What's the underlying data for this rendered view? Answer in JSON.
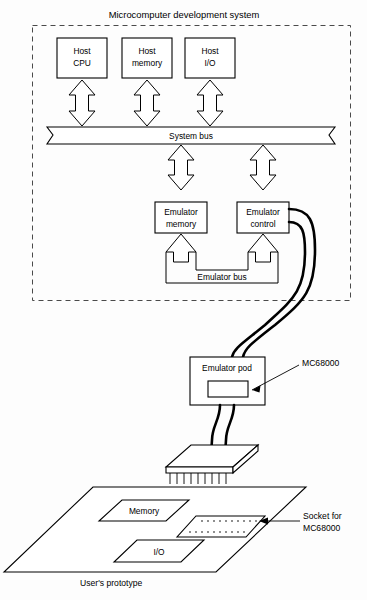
{
  "figure": {
    "title": "Microcomputer development system",
    "caption": "User's prototype"
  },
  "host_blocks": [
    {
      "line1": "Host",
      "line2": "CPU"
    },
    {
      "line1": "Host",
      "line2": "memory"
    },
    {
      "line1": "Host",
      "line2": "I/O"
    }
  ],
  "buses": {
    "system_bus": "System bus",
    "emulator_bus": "Emulator bus"
  },
  "emulator_blocks": [
    {
      "line1": "Emulator",
      "line2": "memory"
    },
    {
      "line1": "Emulator",
      "line2": "control"
    }
  ],
  "pod": {
    "label": "Emulator pod",
    "chip_callout": "MC68000"
  },
  "prototype": {
    "blocks": [
      {
        "label": "Memory"
      },
      {
        "label": "I/O"
      }
    ],
    "socket_callout_line1": "Socket for",
    "socket_callout_line2": "MC68000"
  },
  "icons": {
    "double_arrow": "double-headed-arrow-icon",
    "up_arrow": "up-arrow-icon",
    "cable": "ribbon-cable-icon",
    "dip_package": "dip-chip-icon",
    "socket": "ic-socket-icon",
    "leader_arrow": "leader-arrow-icon"
  },
  "colors": {
    "stroke": "#000000",
    "fill": "#ffffff",
    "dashed": "#4a4a4a",
    "background": "#fdfdfd"
  }
}
